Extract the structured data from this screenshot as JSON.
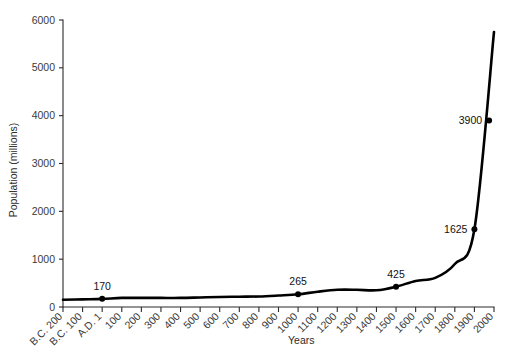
{
  "chart_data": {
    "type": "line",
    "title": "",
    "xlabel": "Years",
    "ylabel": "Population (millions)",
    "ylim": [
      0,
      6000
    ],
    "yticks": [
      0,
      1000,
      2000,
      3000,
      4000,
      5000,
      6000
    ],
    "ytick_labels": [
      "0",
      "1000",
      "2000",
      "3000",
      "4000",
      "5000",
      "6000"
    ],
    "grid": false,
    "legend": null,
    "x_categories": [
      "B.C. 200",
      "B.C. 100",
      "A.D. 1",
      "100",
      "200",
      "300",
      "400",
      "500",
      "600",
      "700",
      "800",
      "900",
      "1000",
      "1100",
      "1200",
      "1300",
      "1400",
      "1500",
      "1600",
      "1700",
      "1800",
      "1900",
      "2000"
    ],
    "x_values": [
      -200,
      -100,
      1,
      100,
      200,
      300,
      400,
      500,
      600,
      700,
      800,
      900,
      1000,
      1100,
      1200,
      1300,
      1400,
      1500,
      1600,
      1700,
      1800,
      1900,
      2000
    ],
    "values": [
      150,
      160,
      170,
      190,
      190,
      190,
      190,
      200,
      210,
      215,
      220,
      240,
      265,
      320,
      360,
      360,
      350,
      425,
      545,
      610,
      900,
      1625,
      5750
    ],
    "annotations": [
      {
        "label": "170",
        "x": 1,
        "y": 170
      },
      {
        "label": "265",
        "x": 1000,
        "y": 265
      },
      {
        "label": "425",
        "x": 1500,
        "y": 425
      },
      {
        "label": "1625",
        "x": 1900,
        "y": 1625
      },
      {
        "label": "3900",
        "x": 1975,
        "y": 3900
      }
    ],
    "colors": {
      "line": "#000000",
      "marker": "#000000",
      "axis": "#2b2b2b",
      "text": "#333333"
    }
  }
}
